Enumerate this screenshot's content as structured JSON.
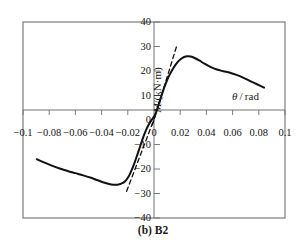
{
  "figure": {
    "caption": "(b) B2",
    "xlabel": "θ / rad",
    "ylabel": "M/(kN·m)"
  },
  "chart_data": {
    "type": "line",
    "title": "(b) B2",
    "xlabel": "θ / rad",
    "ylabel": "M/(kN·m)",
    "xlim": [
      -0.1,
      0.1
    ],
    "ylim": [
      -40,
      40
    ],
    "xticks": [
      -0.1,
      -0.08,
      -0.06,
      -0.04,
      -0.02,
      0,
      0.02,
      0.04,
      0.06,
      0.08,
      0.1
    ],
    "xticklabels": [
      "-0.1",
      "-0.08",
      "-0.06",
      "-0.04",
      "-0.02",
      "0",
      "0.02",
      "0.04",
      "0.06",
      "0.08",
      "0.1"
    ],
    "yticks": [
      -40,
      -30,
      -20,
      -10,
      0,
      10,
      20,
      30,
      40
    ],
    "yticklabels": [
      "-40",
      "-30",
      "-20",
      "-10",
      "0",
      "10",
      "20",
      "30",
      "40"
    ],
    "grid": false,
    "legend": null,
    "axes_style": "box-with-zero-crosshair",
    "series": [
      {
        "name": "skeleton-curve",
        "style": "solid",
        "color": "#111111",
        "points": [
          [
            -0.0895,
            -16.0
          ],
          [
            -0.084,
            -17.3
          ],
          [
            -0.078,
            -18.6
          ],
          [
            -0.072,
            -19.8
          ],
          [
            -0.066,
            -20.8
          ],
          [
            -0.06,
            -21.7
          ],
          [
            -0.054,
            -22.6
          ],
          [
            -0.048,
            -23.6
          ],
          [
            -0.043,
            -24.6
          ],
          [
            -0.039,
            -25.4
          ],
          [
            -0.035,
            -26.0
          ],
          [
            -0.031,
            -26.4
          ],
          [
            -0.028,
            -26.4
          ],
          [
            -0.025,
            -26.0
          ],
          [
            -0.022,
            -25.0
          ],
          [
            -0.0195,
            -23.2
          ],
          [
            -0.0175,
            -21.0
          ],
          [
            -0.0155,
            -18.4
          ],
          [
            -0.0135,
            -15.4
          ],
          [
            -0.0115,
            -12.2
          ],
          [
            -0.0095,
            -9.0
          ],
          [
            -0.0075,
            -6.0
          ],
          [
            -0.0055,
            -3.4
          ],
          [
            -0.0035,
            -1.4
          ],
          [
            -0.0015,
            0.2
          ],
          [
            0.0,
            1.4
          ],
          [
            0.0015,
            3.0
          ],
          [
            0.0035,
            6.2
          ],
          [
            0.0055,
            9.6
          ],
          [
            0.0075,
            12.8
          ],
          [
            0.0095,
            15.6
          ],
          [
            0.0115,
            18.0
          ],
          [
            0.0135,
            20.0
          ],
          [
            0.0155,
            21.8
          ],
          [
            0.018,
            23.6
          ],
          [
            0.0205,
            24.9
          ],
          [
            0.023,
            25.7
          ],
          [
            0.0255,
            26.0
          ],
          [
            0.028,
            25.9
          ],
          [
            0.031,
            25.3
          ],
          [
            0.0345,
            24.3
          ],
          [
            0.0385,
            23.0
          ],
          [
            0.043,
            21.7
          ],
          [
            0.048,
            20.6
          ],
          [
            0.053,
            19.9
          ],
          [
            0.058,
            19.3
          ],
          [
            0.063,
            18.4
          ],
          [
            0.068,
            17.3
          ],
          [
            0.073,
            16.0
          ],
          [
            0.079,
            14.5
          ],
          [
            0.084,
            13.2
          ]
        ]
      },
      {
        "name": "initial-stiffness-tangent-positive",
        "style": "dashed",
        "color": "#111111",
        "points": [
          [
            -0.0012,
            -2.0
          ],
          [
            0.0172,
            30.0
          ]
        ]
      },
      {
        "name": "initial-stiffness-tangent-negative",
        "style": "dashed",
        "color": "#111111",
        "points": [
          [
            0.0012,
            2.0
          ],
          [
            -0.0212,
            -29.5
          ]
        ]
      }
    ]
  }
}
